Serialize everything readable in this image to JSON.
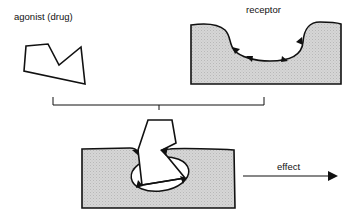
{
  "labels": {
    "agonist": "agonist (drug)",
    "receptor": "receptor",
    "effect": "effect"
  },
  "colors": {
    "stroke": "#111111",
    "receptor_fill": "#d4d4d4",
    "background": "#ffffff"
  }
}
